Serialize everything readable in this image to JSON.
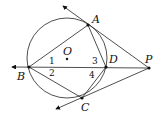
{
  "diagram": {
    "type": "geometry",
    "points": {
      "A": {
        "label": "A",
        "x": 88,
        "y": 25
      },
      "B": {
        "label": "B",
        "x": 29,
        "y": 67
      },
      "C": {
        "label": "C",
        "x": 82,
        "y": 98
      },
      "D": {
        "label": "D",
        "x": 106,
        "y": 67
      },
      "P": {
        "label": "P",
        "x": 149,
        "y": 68
      },
      "O": {
        "label": "O",
        "x": 67,
        "y": 59
      }
    },
    "circle": {
      "center": "O",
      "cx": 67,
      "cy": 58,
      "r": 40
    },
    "angle_labels": [
      "1",
      "2",
      "3",
      "4"
    ],
    "segments": [
      "BA",
      "BC",
      "AD",
      "DC",
      "AP",
      "CP",
      "BP"
    ],
    "rays": [
      "PA extended beyond A",
      "PC extended beyond C",
      "PB extended beyond B"
    ]
  }
}
